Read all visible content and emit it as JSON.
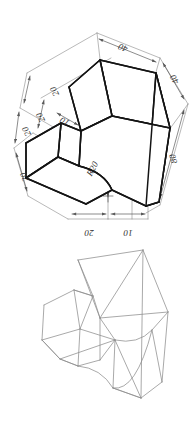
{
  "drawing": {
    "title": "Isometric Part Drawing",
    "views": [
      {
        "name": "dimensioned-isometric-view",
        "style": "solid-black-lines"
      },
      {
        "name": "wireframe-isometric-view",
        "style": "light-gray-lines"
      }
    ],
    "line_colors": {
      "solid_edge": "#141414",
      "wireframe_edge": "#8c8c8c",
      "dimension_line": "#5a5a5a",
      "extension_line": "#8a8a8a",
      "background": "#ffffff"
    }
  },
  "dimensions": {
    "left_upper_1": "20",
    "left_upper_2": "20",
    "left_upper_3": "20",
    "left_lower": "20",
    "notch_depth": "10",
    "top": "40",
    "right_upper": "40",
    "right_lower": "80",
    "radius": "R20",
    "bottom_left": "20",
    "bottom_right": "10"
  }
}
